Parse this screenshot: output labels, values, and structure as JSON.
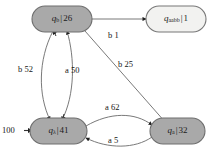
{
  "diagram": {
    "type": "state-machine",
    "title": "",
    "colors": {
      "node_fill_gray": "#a9a9a9",
      "node_fill_light": "#f2f2f0",
      "node_stroke": "#6e6e6e",
      "edge_stroke": "#5a5a5a",
      "text": "#161616",
      "background": "#ffffff"
    },
    "nodes": [
      {
        "id": "q_b",
        "state": "q",
        "subscript": "b",
        "separator": "|",
        "count": "26",
        "fill": "gray",
        "x": 61,
        "y": 19
      },
      {
        "id": "q_aabb",
        "state": "q",
        "subscript": "aabb",
        "separator": "|",
        "count": "1",
        "fill": "light",
        "x": 175,
        "y": 19
      },
      {
        "id": "q_lambda",
        "state": "q",
        "subscript": "λ",
        "separator": "|",
        "count": "41",
        "fill": "gray",
        "x": 57,
        "y": 131
      },
      {
        "id": "q_a",
        "state": "q",
        "subscript": "a",
        "separator": "|",
        "count": "32",
        "fill": "gray",
        "x": 176,
        "y": 131
      }
    ],
    "edges": [
      {
        "id": "e-b1",
        "from": "q_b",
        "to": "q_aabb",
        "symbol": "b",
        "weight": "1",
        "label": "b 1",
        "lx": 108,
        "ly": 31
      },
      {
        "id": "e-b52",
        "from": "q_b",
        "to": "q_lambda",
        "symbol": "b",
        "weight": "52",
        "label": "b 52",
        "lx": 18,
        "ly": 65
      },
      {
        "id": "e-a50",
        "from": "q_lambda",
        "to": "q_b",
        "symbol": "a",
        "weight": "50",
        "label": "a 50",
        "lx": 65,
        "ly": 66
      },
      {
        "id": "e-b25",
        "from": "q_b",
        "to": "q_a",
        "symbol": "b",
        "weight": "25",
        "label": "b 25",
        "lx": 118,
        "ly": 60
      },
      {
        "id": "e-a62",
        "from": "q_lambda",
        "to": "q_a",
        "symbol": "a",
        "weight": "62",
        "label": "a 62",
        "lx": 105,
        "ly": 104
      },
      {
        "id": "e-a5",
        "from": "q_a",
        "to": "q_lambda",
        "symbol": "a",
        "weight": "5",
        "label": "a 5",
        "lx": 108,
        "ly": 136
      }
    ],
    "start": {
      "label": "100",
      "target": "q_lambda",
      "lx": 2,
      "ly": 126
    }
  }
}
